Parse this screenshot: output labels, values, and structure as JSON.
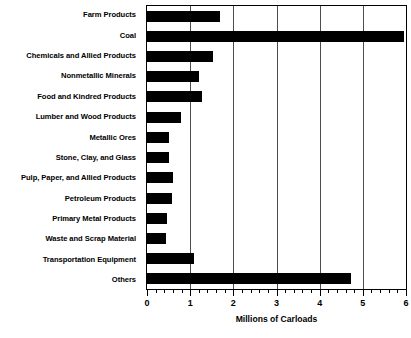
{
  "chart_data": {
    "type": "bar",
    "orientation": "horizontal",
    "title": "",
    "xlabel": "Millions of Carloads",
    "ylabel": "",
    "xlim": [
      0,
      6
    ],
    "ylim": null,
    "grid": true,
    "legend": false,
    "bar_color": "#000000",
    "background_color": "#ffffff",
    "axis_color": "#000000",
    "gridline_color": "#4d4d4d",
    "x_major_ticks": [
      0,
      1,
      2,
      3,
      4,
      5,
      6
    ],
    "x_tick_labels": [
      "0",
      "1",
      "2",
      "3",
      "4",
      "5",
      "6"
    ],
    "x_minor_tick_interval": 0.2,
    "categories": [
      "Farm Products",
      "Coal",
      "Chemicals and Allied Products",
      "Nonmetallic Minerals",
      "Food and Kindred Products",
      "Lumber and Wood Products",
      "Metallic Ores",
      "Stone, Clay, and Glass",
      "Pulp, Paper, and Allied Products",
      "Petroleum Products",
      "Primary Metal Products",
      "Waste and Scrap Material",
      "Transportation Equipment",
      "Others"
    ],
    "values": [
      1.7,
      5.95,
      1.53,
      1.2,
      1.28,
      0.78,
      0.5,
      0.52,
      0.6,
      0.57,
      0.47,
      0.44,
      1.09,
      4.73
    ]
  }
}
